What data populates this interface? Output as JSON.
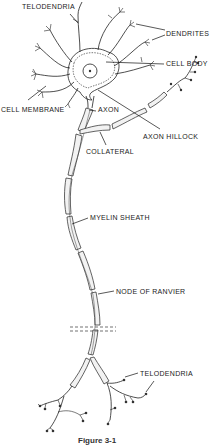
{
  "diagram": {
    "labels": {
      "telodendria_top": "TELODENDRIA",
      "dendrites": "DENDRITES",
      "cell_body": "CELL BODY",
      "cell_membrane": "CELL MEMBRANE",
      "axon": "AXON",
      "axon_hillock": "AXON HILLOCK",
      "collateral": "COLLATERAL",
      "myelin_sheath": "MYELIN SHEATH",
      "node_of_ranvier": "NODE OF RANVIER",
      "telodendria_bottom": "TELODENDRIA"
    },
    "caption": "Figure 3-1"
  }
}
